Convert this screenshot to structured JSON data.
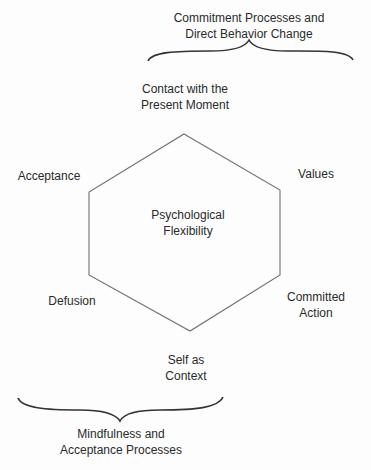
{
  "diagram": {
    "center": {
      "lines": [
        "Psychological",
        "Flexibility"
      ]
    },
    "nodes": [
      {
        "id": "present-moment",
        "lines": [
          "Contact with the",
          "Present Moment"
        ]
      },
      {
        "id": "values",
        "lines": [
          "Values"
        ]
      },
      {
        "id": "committed-action",
        "lines": [
          "Committed",
          "Action"
        ]
      },
      {
        "id": "self-as-context",
        "lines": [
          "Self as",
          "Context"
        ]
      },
      {
        "id": "defusion",
        "lines": [
          "Defusion"
        ]
      },
      {
        "id": "acceptance",
        "lines": [
          "Acceptance"
        ]
      }
    ],
    "groups": [
      {
        "id": "commitment",
        "position": "top",
        "lines": [
          "Commitment Processes and",
          "Direct Behavior Change"
        ]
      },
      {
        "id": "mindfulness",
        "position": "bottom",
        "lines": [
          "Mindfulness and",
          "Acceptance Processes"
        ]
      }
    ],
    "colors": {
      "line": "#6e6e6e",
      "text": "#2a2a2a",
      "background": "#fdfdfd"
    }
  }
}
